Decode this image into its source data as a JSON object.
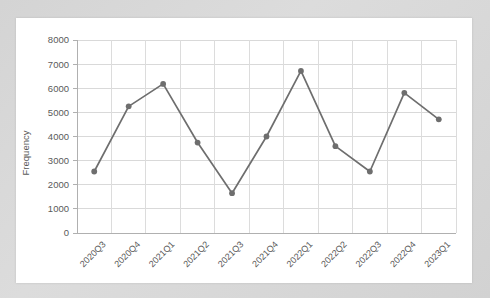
{
  "chart_data": {
    "type": "line",
    "title": "",
    "xlabel": "",
    "ylabel": "Frequency",
    "ylim": [
      0,
      8000
    ],
    "ytick_step": 1000,
    "yticks": [
      "0",
      "1000",
      "2000",
      "3000",
      "4000",
      "5000",
      "6000",
      "7000",
      "8000"
    ],
    "grid": true,
    "legend": "none",
    "categories": [
      "2020Q3",
      "2020Q4",
      "2021Q1",
      "2021Q2",
      "2021Q3",
      "2021Q4",
      "2022Q1",
      "2022Q2",
      "2022Q3",
      "2022Q4",
      "2023Q1"
    ],
    "values": [
      2550,
      5250,
      6180,
      3750,
      1650,
      4000,
      6720,
      3600,
      2550,
      5810,
      4710
    ],
    "series": [
      {
        "name": "Frequency",
        "values": [
          2550,
          5250,
          6180,
          3750,
          1650,
          4000,
          6720,
          3600,
          2550,
          5810,
          4710
        ]
      }
    ],
    "line_color": "#6e6e6e",
    "marker_color": "#6e6e6e",
    "marker_shape": "circle",
    "grid_color": "#d9d9d9",
    "axis_color": "#b0b0b0",
    "plot_background": "#ffffff",
    "page_background": "#d8d8d8"
  }
}
